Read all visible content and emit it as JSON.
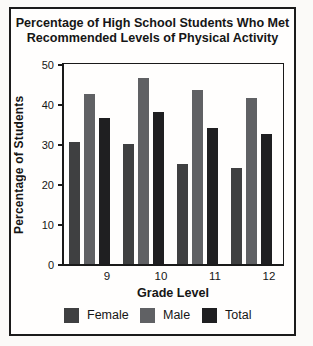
{
  "page": {
    "title_lines": [
      "Percentage of High School Students Who Met",
      "Recommended Levels of Physical Activity"
    ]
  },
  "chart_data": {
    "type": "bar",
    "title": "Percentage of High School Students Who Met Recommended Levels of Physical Activity",
    "categories": [
      "9",
      "10",
      "11",
      "12"
    ],
    "series": [
      {
        "name": "Female",
        "color": "#3f4041",
        "values": [
          30.5,
          30,
          25,
          24
        ]
      },
      {
        "name": "Male",
        "color": "#606164",
        "values": [
          42.5,
          46.5,
          43.5,
          41.5
        ]
      },
      {
        "name": "Total",
        "color": "#1f1f21",
        "values": [
          36.5,
          38,
          34,
          32.5
        ]
      }
    ],
    "xlabel": "Grade Level",
    "ylabel": "Percentage of Students",
    "ylim": [
      0,
      50
    ],
    "yticks": [
      0,
      10,
      20,
      30,
      40,
      50
    ],
    "grid": false,
    "legend_position": "bottom",
    "colors": {
      "axis": "#1a1a1a",
      "text": "#161616",
      "card_border": "#1b1b1b",
      "background": "#fffefd"
    }
  }
}
